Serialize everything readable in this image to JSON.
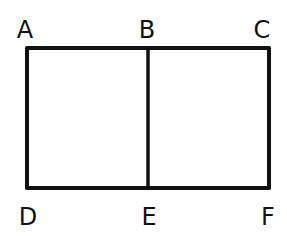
{
  "diagram": {
    "type": "rectangle-divided",
    "stroke_color": "#111111",
    "labels": {
      "top": [
        "A",
        "B",
        "C"
      ],
      "bottom": [
        "D",
        "E",
        "F"
      ]
    },
    "segments": [
      "AB",
      "BC",
      "DE",
      "EF",
      "AD",
      "BE",
      "CF"
    ]
  }
}
